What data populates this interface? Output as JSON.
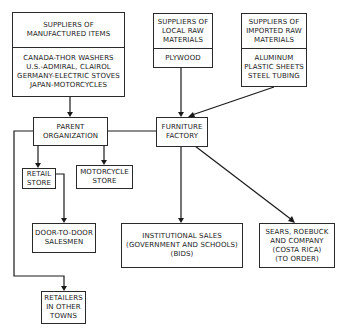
{
  "nodes": {
    "suppliers_manufactured": {
      "header": [
        "SUPPLIERS OF",
        "MANUFACTURED ITEMS"
      ],
      "items": [
        "CANADA-THOR WASHERS",
        "U.S.-ADMIRAL, CLAIROL",
        "GERMANY-ELECTRIC STOVES",
        "JAPAN-MOTORCYCLES"
      ]
    },
    "suppliers_local": {
      "header": [
        "SUPPLIERS OF",
        "LOCAL RAW",
        "MATERIALS"
      ],
      "items": [
        "PLYWOOD"
      ]
    },
    "suppliers_imported": {
      "header": [
        "SUPPLIERS OF",
        "IMPORTED RAW",
        "MATERIALS"
      ],
      "items": [
        "ALUMINUM",
        "PLASTIC SHEETS",
        "STEEL TUBING"
      ]
    },
    "parent_organization": [
      "PARENT",
      "ORGANIZATION"
    ],
    "furniture_factory": [
      "FURNITURE",
      "FACTORY"
    ],
    "retail_store": [
      "RETAIL",
      "STORE"
    ],
    "motorcycle_store": [
      "MOTORCYCLE",
      "STORE"
    ],
    "door_to_door": [
      "DOOR-TO-DOOR",
      "SALESMEN"
    ],
    "retailers_other_towns": [
      "RETAILERS",
      "IN OTHER",
      "TOWNS"
    ],
    "institutional_sales": [
      "INSTITUTIONAL SALES",
      "(GOVERNMENT AND SCHOOLS)",
      "(BIDS)"
    ],
    "sears": [
      "SEARS, ROEBUCK",
      "AND COMPANY",
      "(COSTA RICA)",
      "(TO ORDER)"
    ]
  },
  "edges": [
    {
      "from": "suppliers_manufactured",
      "to": "parent_organization"
    },
    {
      "from": "suppliers_local",
      "to": "furniture_factory"
    },
    {
      "from": "suppliers_imported",
      "to": "furniture_factory"
    },
    {
      "from": "parent_organization",
      "to": "furniture_factory",
      "arrow": false
    },
    {
      "from": "parent_organization",
      "to": "retail_store"
    },
    {
      "from": "parent_organization",
      "to": "motorcycle_store"
    },
    {
      "from": "retail_store",
      "to": "door_to_door"
    },
    {
      "from": "parent_organization",
      "to": "retailers_other_towns"
    },
    {
      "from": "furniture_factory",
      "to": "institutional_sales"
    },
    {
      "from": "furniture_factory",
      "to": "sears"
    }
  ]
}
